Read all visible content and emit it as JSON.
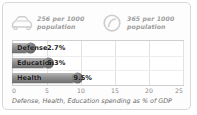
{
  "card": {
    "border_color": "#d8d8d8",
    "background": "#fdfdfd"
  },
  "stats": [
    {
      "icon": "car-icon",
      "line1": "256 per 1000",
      "line2": "population",
      "value": 256,
      "per": 1000,
      "unit": "population"
    },
    {
      "icon": "circle-slash-icon",
      "line1": "365 per 1000",
      "line2": "population",
      "value": 365,
      "per": 1000,
      "unit": "population"
    }
  ],
  "caption": "Defense, Health, Education spending as % of GDP",
  "colors": {
    "bar": "#8f8f8f",
    "bar_cap": "#5f5f5f",
    "grid": "#e2e2e2",
    "axis_text": "#8c8c8c",
    "stat_text": "#9d9d9d",
    "label_text": "#1b1b1b"
  },
  "chart_data": {
    "type": "bar",
    "orientation": "horizontal",
    "title": "",
    "categories": [
      "Defense",
      "Education",
      "Health"
    ],
    "values": [
      2.7,
      5.3,
      9.5
    ],
    "value_labels": [
      "2.7%",
      "5.3%",
      "9.5%"
    ],
    "xlabel": "Defense, Health, Education spending as % of GDP",
    "ylabel": "",
    "xlim": [
      0,
      25
    ],
    "xticks": [
      0,
      5,
      10,
      15,
      20,
      25
    ],
    "xtick_labels": [
      "0",
      "5",
      "10",
      "15",
      "20",
      "25"
    ],
    "grid": true,
    "legend": false
  }
}
